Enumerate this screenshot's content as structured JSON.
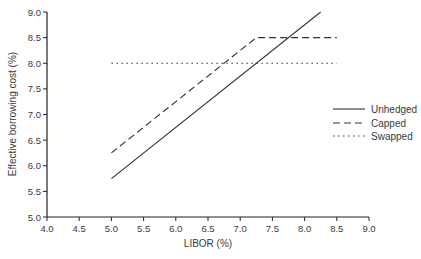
{
  "chart_data": {
    "type": "line",
    "title": "",
    "xlabel": "LIBOR (%)",
    "ylabel": "Effective borrowing cost (%)",
    "xlim": [
      4.0,
      9.0
    ],
    "ylim": [
      5.0,
      9.0
    ],
    "x_ticks": [
      "4.0",
      "4.5",
      "5.0",
      "5.5",
      "6.0",
      "6.5",
      "7.0",
      "7.5",
      "8.0",
      "8.5",
      "9.0"
    ],
    "y_ticks": [
      "5.0",
      "5.5",
      "6.0",
      "6.5",
      "7.0",
      "7.5",
      "8.0",
      "8.5",
      "9.0"
    ],
    "grid": false,
    "legend_position": "right",
    "series": [
      {
        "name": "Unhedged",
        "style": "solid",
        "x": [
          5.0,
          8.25
        ],
        "y": [
          5.75,
          9.0
        ]
      },
      {
        "name": "Capped",
        "style": "dashed",
        "x": [
          5.0,
          7.25,
          8.5
        ],
        "y": [
          6.25,
          8.5,
          8.5
        ]
      },
      {
        "name": "Swapped",
        "style": "dotted",
        "x": [
          5.0,
          8.5
        ],
        "y": [
          8.0,
          8.0
        ]
      }
    ]
  },
  "legend": {
    "items": [
      "Unhedged",
      "Capped",
      "Swapped"
    ]
  },
  "colors": {
    "line": "#333333",
    "text": "#3a3a3a"
  }
}
